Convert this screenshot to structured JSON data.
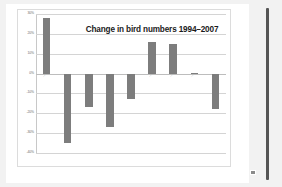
{
  "slide": {
    "corner_glyph_name": "image-placeholder-icon",
    "right_strip_name": "scrollbar-strip"
  },
  "chart_data": {
    "type": "bar",
    "title": "Change in bird numbers 1994–2007",
    "xlabel": "",
    "ylabel": "",
    "ylim": [
      -40,
      30
    ],
    "grid": true,
    "legend": "none",
    "ytick_labels": [
      "30%",
      "20%",
      "10%",
      "0%",
      "-10%",
      "-20%",
      "-30%",
      "-40%"
    ],
    "ytick_values": [
      30,
      20,
      10,
      0,
      -10,
      -20,
      -30,
      -40
    ],
    "categories": [
      "…",
      "…",
      "…",
      "…",
      "…",
      "…",
      "…",
      "…",
      "…"
    ],
    "values": [
      28,
      -35,
      -17,
      -27,
      -13,
      16,
      15,
      0.5,
      -18
    ],
    "bar_color": "#7d7d7d"
  }
}
